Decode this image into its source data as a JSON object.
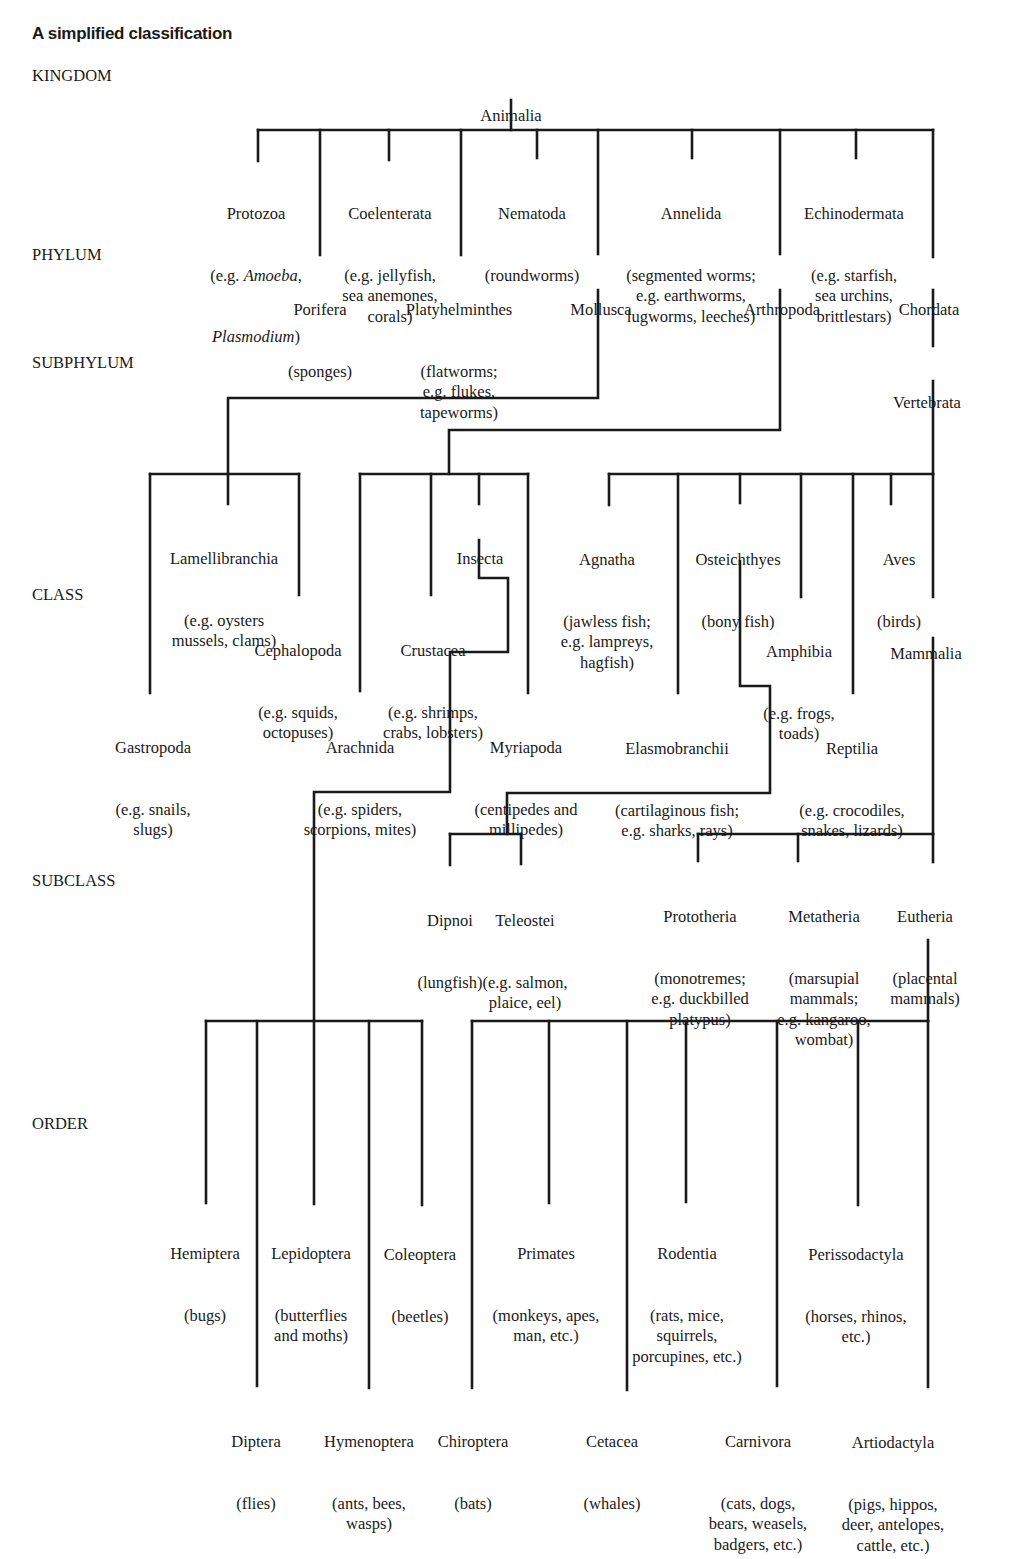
{
  "title": "A simplified classification",
  "ranks": {
    "kingdom": "KINGDOM",
    "phylum": "PHYLUM",
    "subphylum": "SUBPHYLUM",
    "class": "CLASS",
    "subclass": "SUBCLASS",
    "order": "ORDER"
  },
  "kingdom": {
    "name": "Animalia"
  },
  "phyla": {
    "protozoa": {
      "name": "Protozoa",
      "desc_prefix": "(e.g. ",
      "desc_italic1": "Amoeba",
      "desc_mid": ",",
      "desc_italic2": "Plasmodium",
      "desc_suffix": ")"
    },
    "porifera": {
      "name": "Porifera",
      "desc": "(sponges)"
    },
    "coelenterata": {
      "name": "Coelenterata",
      "desc": "(e.g. jellyfish,\nsea anemones,\ncorals)"
    },
    "platyhelminthes": {
      "name": "Platyhelminthes",
      "desc": "(flatworms;\ne.g. flukes,\ntapeworms)"
    },
    "nematoda": {
      "name": "Nematoda",
      "desc": "(roundworms)"
    },
    "mollusca": {
      "name": "Mollusca"
    },
    "annelida": {
      "name": "Annelida",
      "desc": "(segmented worms;\ne.g. earthworms,\nlugworms, leeches)"
    },
    "arthropoda": {
      "name": "Arthropoda"
    },
    "echinodermata": {
      "name": "Echinodermata",
      "desc": "(e.g. starfish,\nsea urchins,\nbrittlestars)"
    },
    "chordata": {
      "name": "Chordata"
    }
  },
  "subphyla": {
    "vertebrata": {
      "name": "Vertebrata"
    }
  },
  "classes": {
    "gastropoda": {
      "name": "Gastropoda",
      "desc": "(e.g. snails,\nslugs)"
    },
    "lamellibranchia": {
      "name": "Lamellibranchia",
      "desc": "(e.g. oysters\nmussels, clams)"
    },
    "cephalopoda": {
      "name": "Cephalopoda",
      "desc": "(e.g. squids,\noctopuses)"
    },
    "arachnida": {
      "name": "Arachnida",
      "desc": "(e.g. spiders,\nscorpions, mites)"
    },
    "crustacea": {
      "name": "Crustacea",
      "desc": "(e.g. shrimps,\ncrabs, lobsters)"
    },
    "insecta": {
      "name": "Insecta"
    },
    "myriapoda": {
      "name": "Myriapoda",
      "desc": "(centipedes and\nmillipedes)"
    },
    "agnatha": {
      "name": "Agnatha",
      "desc": "(jawless fish;\ne.g. lampreys,\nhagfish)"
    },
    "elasmobranchii": {
      "name": "Elasmobranchii",
      "desc": "(cartilaginous fish;\ne.g. sharks, rays)"
    },
    "osteichthyes": {
      "name": "Osteichthyes",
      "desc": "(bony fish)"
    },
    "amphibia": {
      "name": "Amphibia",
      "desc": "(e.g. frogs,\ntoads)"
    },
    "reptilia": {
      "name": "Reptilia",
      "desc": "(e.g. crocodiles,\nsnakes, lizards)"
    },
    "aves": {
      "name": "Aves",
      "desc": "(birds)"
    },
    "mammalia": {
      "name": "Mammalia"
    }
  },
  "subclasses": {
    "dipnoi": {
      "name": "Dipnoi",
      "desc": "(lungfish)"
    },
    "teleostei": {
      "name": "Teleostei",
      "desc": "(e.g. salmon,\nplaice, eel)"
    },
    "prototheria": {
      "name": "Prototheria",
      "desc": "(monotremes;\ne.g. duckbilled\nplatypus)"
    },
    "metatheria": {
      "name": "Metatheria",
      "desc": "(marsupial\nmammals;\ne.g. kangaroo,\nwombat)"
    },
    "eutheria": {
      "name": "Eutheria",
      "desc": "(placental\nmammals)"
    }
  },
  "orders": {
    "hemiptera": {
      "name": "Hemiptera",
      "desc": "(bugs)"
    },
    "diptera": {
      "name": "Diptera",
      "desc": "(flies)"
    },
    "lepidoptera": {
      "name": "Lepidoptera",
      "desc": "(butterflies\nand moths)"
    },
    "hymenoptera": {
      "name": "Hymenoptera",
      "desc": "(ants, bees,\nwasps)"
    },
    "coleoptera": {
      "name": "Coleoptera",
      "desc": "(beetles)"
    },
    "chiroptera": {
      "name": "Chiroptera",
      "desc": "(bats)"
    },
    "primates": {
      "name": "Primates",
      "desc": "(monkeys, apes,\nman, etc.)"
    },
    "cetacea": {
      "name": "Cetacea",
      "desc": "(whales)"
    },
    "rodentia": {
      "name": "Rodentia",
      "desc": "(rats, mice,\nsquirrels,\nporcupines, etc.)"
    },
    "carnivora": {
      "name": "Carnivora",
      "desc": "(cats, dogs,\nbears, weasels,\nbadgers, etc.)"
    },
    "perissodactyla": {
      "name": "Perissodactyla",
      "desc": "(horses, rhinos,\netc.)"
    },
    "artiodactyla": {
      "name": "Artiodactyla",
      "desc": "(pigs, hippos,\ndeer, antelopes,\ncattle, etc.)"
    }
  },
  "colors": {
    "ink": "#1a1a1a",
    "background": "#ffffff"
  }
}
